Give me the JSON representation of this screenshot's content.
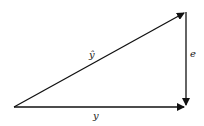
{
  "diagram": {
    "type": "vector-triangle",
    "vectors": [
      {
        "id": "y_hat",
        "label": "ŷ",
        "from": [
          14,
          107
        ],
        "to": [
          186,
          12
        ]
      },
      {
        "id": "e",
        "label": "e",
        "from": [
          186,
          12
        ],
        "to": [
          186,
          107
        ]
      },
      {
        "id": "y",
        "label": "y",
        "from": [
          14,
          107
        ],
        "to": [
          186,
          107
        ]
      }
    ],
    "labels": {
      "y_hat": "ŷ",
      "e": "e",
      "y": "y"
    },
    "stroke_color": "#111111"
  }
}
